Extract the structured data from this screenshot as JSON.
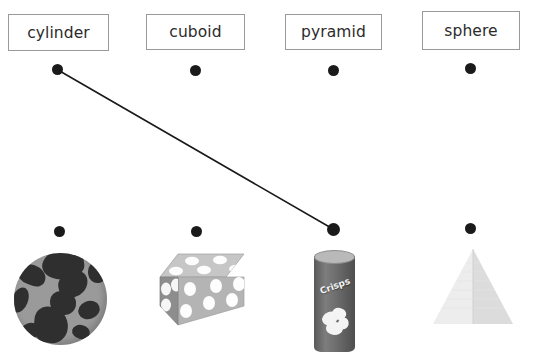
{
  "worksheet": {
    "title": "Shape name to object matching worksheet",
    "background_color": "#ffffff",
    "line_color": "#1a1a1a",
    "dot_color": "#1a1a1a",
    "box_border_color": "#9a9a9a"
  },
  "word_labels": [
    {
      "label": "cylinder",
      "name": "word-box-cylinder"
    },
    {
      "label": "cuboid",
      "name": "word-box-cuboid"
    },
    {
      "label": "pyramid",
      "name": "word-box-pyramid"
    },
    {
      "label": "sphere",
      "name": "word-box-sphere"
    }
  ],
  "top_dots": [
    {
      "label": "cylinder-dot"
    },
    {
      "label": "cuboid-dot"
    },
    {
      "label": "pyramid-dot"
    },
    {
      "label": "sphere-dot"
    }
  ],
  "pictures": [
    {
      "name": "globe-picture",
      "alt": "globe",
      "shape_answer": "sphere",
      "colors": {
        "ocean": "#9a9a9a",
        "land": "#2f2f2f"
      }
    },
    {
      "name": "dice-block-picture",
      "alt": "spotted block",
      "shape_answer": "cuboid",
      "colors": {
        "top": "#c4c4c4",
        "front": "#b2b2b2",
        "side": "#8a8a8a",
        "spots": "#fdfdfd"
      }
    },
    {
      "name": "crisps-tube-picture",
      "alt": "crisps tube",
      "shape_answer": "cylinder",
      "brand_text": "Crisps",
      "colors": {
        "body": "#6b6b6b",
        "lid": "#b9b9b9",
        "text": "#f2f2f2"
      }
    },
    {
      "name": "pyramid-picture",
      "alt": "pyramid",
      "shape_answer": "pyramid",
      "colors": {
        "left": "#ebebeb",
        "right": "#dcdcdc"
      }
    }
  ],
  "bottom_dots": [
    {
      "label": "globe-dot"
    },
    {
      "label": "dice-block-dot"
    },
    {
      "label": "crisps-tube-dot"
    },
    {
      "label": "pyramid-dot"
    }
  ],
  "drawn_answers": [
    {
      "from": "cylinder-word-dot",
      "to": "crisps-tube-dot",
      "x1": 58,
      "y1": 70,
      "x2": 333,
      "y2": 229,
      "stroke": "#1a1a1a",
      "stroke_width": 1.6
    }
  ]
}
